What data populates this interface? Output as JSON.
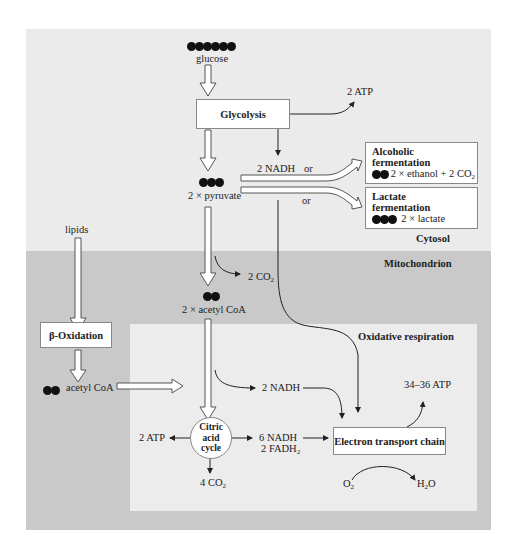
{
  "regions": {
    "cytosol": {
      "label": "Cytosol",
      "color": "#ebebeb"
    },
    "mitochondrion": {
      "label": "Mitochondrion",
      "color": "#c9c9c9"
    },
    "oxidative_respiration": {
      "label": "Oxidative respiration",
      "color": "#ececec"
    }
  },
  "nodes": {
    "glucose": {
      "label": "glucose",
      "carbons": 6
    },
    "glycolysis": {
      "label": "Glycolysis"
    },
    "glycolysis_atp": {
      "label": "2 ATP"
    },
    "nadh_glycolysis": {
      "label": "2 NADH"
    },
    "or1": {
      "label": "or"
    },
    "or2": {
      "label": "or"
    },
    "pyruvate": {
      "label": "2 × pyruvate",
      "carbons": 3
    },
    "alcoholic": {
      "title1": "Alcoholic",
      "title2": "fermentation",
      "product": "2 × ethanol + 2 CO",
      "product_sub": "2",
      "carbons": 2
    },
    "lactate": {
      "title1": "Lactate",
      "title2": "fermentation",
      "product": "2 × lactate",
      "carbons": 3
    },
    "lipids": {
      "label": "lipids"
    },
    "beta_oxidation": {
      "label": "β-Oxidation"
    },
    "acetyl_coa_lipid": {
      "label": "acetyl CoA",
      "carbons": 2
    },
    "co2_pdh": {
      "label": "2 CO",
      "sub": "2"
    },
    "acetyl_coa": {
      "label": "2 × acetyl CoA",
      "carbons": 2
    },
    "nadh_pdh": {
      "label": "2 NADH"
    },
    "citric_acid_cycle": {
      "line1": "Citric",
      "line2": "acid",
      "line3": "cycle"
    },
    "cac_atp": {
      "label": "2 ATP"
    },
    "cac_nadh": {
      "label": "6 NADH"
    },
    "cac_fadh": {
      "label": "2 FADH",
      "sub": "2"
    },
    "cac_co2": {
      "label": "4 CO",
      "sub": "2"
    },
    "etc": {
      "label": "Electron transport chain"
    },
    "etc_atp": {
      "label": "34–36 ATP"
    },
    "o2": {
      "label": "O",
      "sub": "2"
    },
    "h2o": {
      "label_pre": "H",
      "sub": "2",
      "label_post": "O"
    }
  }
}
